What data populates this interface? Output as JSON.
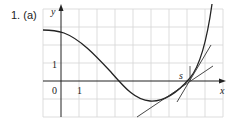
{
  "problem": {
    "label": "1. (a)"
  },
  "axes": {
    "x_label": "x",
    "y_label": "y",
    "origin_label": "0",
    "x_tick_label": "1",
    "y_tick_label": "1"
  },
  "annotations": {
    "point_label": "s"
  },
  "colors": {
    "grid": "#d4d4d4",
    "axis": "#222222",
    "curve": "#222222"
  }
}
